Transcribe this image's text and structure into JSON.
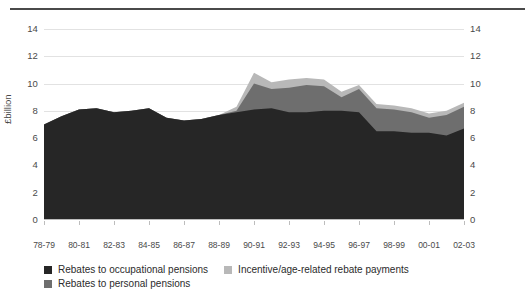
{
  "chart_data": {
    "type": "area",
    "stacked": true,
    "title": "",
    "subtitle": "",
    "xlabel": "",
    "ylabel": "£billion",
    "ylim": [
      0,
      14
    ],
    "yticks": [
      0,
      2,
      4,
      6,
      8,
      10,
      12,
      14
    ],
    "grid": true,
    "dual_axis_labels": true,
    "legend_position": "bottom-left",
    "categories": [
      "78-79",
      "79-80",
      "80-81",
      "81-82",
      "82-83",
      "83-84",
      "84-85",
      "85-86",
      "86-87",
      "87-88",
      "88-89",
      "89-90",
      "90-91",
      "91-92",
      "92-93",
      "93-94",
      "94-95",
      "95-96",
      "96-97",
      "97-98",
      "98-99",
      "99-00",
      "00-01",
      "01-02",
      "02-03"
    ],
    "tick_labels": [
      "78-79",
      "80-81",
      "82-83",
      "84-85",
      "86-87",
      "88-89",
      "90-91",
      "92-93",
      "94-95",
      "96-97",
      "98-99",
      "00-01",
      "02-03"
    ],
    "series": [
      {
        "name": "Rebates to occupational pensions",
        "color": "#262626",
        "values": [
          7.0,
          7.6,
          8.1,
          8.2,
          7.9,
          8.0,
          8.2,
          7.5,
          7.3,
          7.4,
          7.7,
          7.9,
          8.1,
          8.2,
          7.9,
          7.9,
          8.0,
          8.0,
          7.9,
          6.5,
          6.5,
          6.4,
          6.4,
          6.2,
          6.7
        ]
      },
      {
        "name": "Rebates to personal pensions",
        "color": "#6e6e6e",
        "values": [
          0,
          0,
          0,
          0,
          0,
          0,
          0,
          0,
          0,
          0,
          0,
          0.1,
          1.9,
          1.4,
          1.8,
          2.0,
          1.8,
          1.0,
          1.7,
          1.7,
          1.6,
          1.5,
          1.1,
          1.5,
          1.6
        ]
      },
      {
        "name": "Incentive/age-related rebate payments",
        "color": "#b8b8b8",
        "values": [
          0,
          0,
          0,
          0,
          0,
          0,
          0,
          0,
          0,
          0,
          0,
          0.3,
          0.8,
          0.5,
          0.6,
          0.5,
          0.5,
          0.4,
          0.3,
          0.3,
          0.3,
          0.3,
          0.3,
          0.3,
          0.3
        ]
      }
    ]
  },
  "legend": {
    "items": [
      {
        "label": "Rebates to occupational pensions",
        "color": "#262626"
      },
      {
        "label": "Incentive/age-related rebate payments",
        "color": "#b8b8b8"
      },
      {
        "label": "Rebates to personal pensions",
        "color": "#6e6e6e"
      }
    ]
  }
}
